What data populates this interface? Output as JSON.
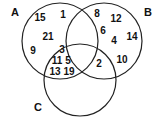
{
  "diagram": {
    "type": "venn",
    "sets": [
      {
        "label": "A",
        "cx": 60,
        "cy": 41,
        "r": 38,
        "label_x": 15,
        "label_y": 13
      },
      {
        "label": "B",
        "cx": 104,
        "cy": 41,
        "r": 38,
        "label_x": 148,
        "label_y": 13
      },
      {
        "label": "C",
        "cx": 80,
        "cy": 80,
        "r": 36,
        "label_x": 38,
        "label_y": 108
      }
    ],
    "regions": {
      "A_only": [
        {
          "value": "15",
          "x": 40,
          "y": 18
        },
        {
          "value": "1",
          "x": 63,
          "y": 15
        },
        {
          "value": "21",
          "x": 48,
          "y": 37
        },
        {
          "value": "9",
          "x": 33,
          "y": 51
        }
      ],
      "B_only": [
        {
          "value": "8",
          "x": 97,
          "y": 14
        },
        {
          "value": "12",
          "x": 116,
          "y": 19
        },
        {
          "value": "6",
          "x": 103,
          "y": 31
        },
        {
          "value": "4",
          "x": 114,
          "y": 41
        },
        {
          "value": "14",
          "x": 132,
          "y": 37
        },
        {
          "value": "10",
          "x": 122,
          "y": 60
        }
      ],
      "A_and_C": [
        {
          "value": "3",
          "x": 62,
          "y": 50
        },
        {
          "value": "11",
          "x": 57,
          "y": 61
        },
        {
          "value": "5",
          "x": 68,
          "y": 61
        },
        {
          "value": "13",
          "x": 55,
          "y": 72
        },
        {
          "value": "19",
          "x": 69,
          "y": 72
        }
      ],
      "B_and_C": [
        {
          "value": "2",
          "x": 99,
          "y": 64
        }
      ],
      "A_and_B": [],
      "A_and_B_and_C": []
    }
  }
}
